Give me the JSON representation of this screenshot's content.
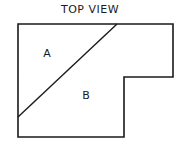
{
  "diagram": {
    "title": "TOP VIEW",
    "stroke_color": "#1a1a1a",
    "background": "#ffffff",
    "outline": {
      "shape": "L-shaped polygon",
      "points": [
        [
          18,
          24
        ],
        [
          173,
          24
        ],
        [
          173,
          77
        ],
        [
          124,
          77
        ],
        [
          124,
          137
        ],
        [
          18,
          137
        ]
      ]
    },
    "divider": {
      "type": "diagonal-line",
      "from": [
        117,
        24
      ],
      "to": [
        18,
        117
      ]
    },
    "regions": [
      {
        "label": "A",
        "x": 47,
        "y": 54
      },
      {
        "label": "B",
        "x": 86,
        "y": 96
      }
    ]
  }
}
